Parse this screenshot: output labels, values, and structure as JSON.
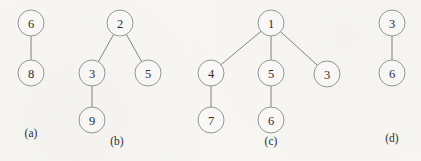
{
  "figure": {
    "caption_style": "lettered-subfigures",
    "background_color": "#f7f6f3",
    "node_fill_color": "#faf9f7",
    "node_stroke_color": "#8a8a8a",
    "edge_color": "#757575",
    "text_color": "#2e2e2e",
    "node_radius": 13
  },
  "chart_data": {
    "type": "diagram",
    "diagram_kind": "rooted-trees",
    "title": "",
    "subfigures": [
      {
        "label": "(a)",
        "label_x": 31,
        "label_y": 133,
        "nodes": [
          {
            "id": "a1",
            "value": "6",
            "x": 31,
            "y": 23
          },
          {
            "id": "a2",
            "value": "8",
            "x": 31,
            "y": 73
          }
        ],
        "edges": [
          {
            "from": "a1",
            "to": "a2"
          }
        ]
      },
      {
        "label": "(b)",
        "label_x": 117,
        "label_y": 141,
        "nodes": [
          {
            "id": "b1",
            "value": "2",
            "x": 120,
            "y": 23
          },
          {
            "id": "b2",
            "value": "3",
            "x": 92,
            "y": 73
          },
          {
            "id": "b3",
            "value": "5",
            "x": 148,
            "y": 73
          },
          {
            "id": "b4",
            "value": "9",
            "x": 92,
            "y": 120
          }
        ],
        "edges": [
          {
            "from": "b1",
            "to": "b2"
          },
          {
            "from": "b1",
            "to": "b3"
          },
          {
            "from": "b2",
            "to": "b4"
          }
        ]
      },
      {
        "label": "(c)",
        "label_x": 271,
        "label_y": 141,
        "nodes": [
          {
            "id": "c1",
            "value": "1",
            "x": 271,
            "y": 23
          },
          {
            "id": "c2",
            "value": "4",
            "x": 211,
            "y": 73
          },
          {
            "id": "c3",
            "value": "5",
            "x": 271,
            "y": 73
          },
          {
            "id": "c4",
            "value": "3",
            "x": 327,
            "y": 74
          },
          {
            "id": "c5",
            "value": "7",
            "x": 211,
            "y": 120
          },
          {
            "id": "c6",
            "value": "6",
            "x": 271,
            "y": 120
          }
        ],
        "edges": [
          {
            "from": "c1",
            "to": "c2"
          },
          {
            "from": "c1",
            "to": "c3"
          },
          {
            "from": "c1",
            "to": "c4"
          },
          {
            "from": "c2",
            "to": "c5"
          },
          {
            "from": "c3",
            "to": "c6"
          }
        ]
      },
      {
        "label": "(d)",
        "label_x": 392,
        "label_y": 138,
        "nodes": [
          {
            "id": "d1",
            "value": "3",
            "x": 392,
            "y": 23
          },
          {
            "id": "d2",
            "value": "6",
            "x": 392,
            "y": 73
          }
        ],
        "edges": [
          {
            "from": "d1",
            "to": "d2"
          }
        ]
      }
    ]
  }
}
